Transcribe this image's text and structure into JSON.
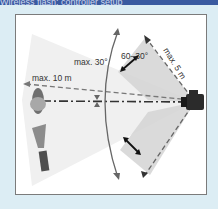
{
  "header": {
    "title": "Wireless flash: controller setup"
  },
  "diagram": {
    "labels": {
      "angle_max": "max. 30°",
      "distance_flash": "max. 10 m",
      "angle_range": "60–30°",
      "distance_camera": "max. 5 m"
    },
    "colors": {
      "header": "#3a5aa0",
      "background": "#dcedf4",
      "panel": "#ffffff",
      "fan_light": "#efefef",
      "fan_dark": "#d6d6d6",
      "line": "#555555"
    }
  }
}
